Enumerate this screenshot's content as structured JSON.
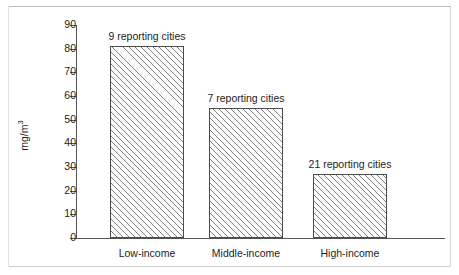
{
  "chart_data": {
    "type": "bar",
    "title": "",
    "subtitle": "",
    "xlabel": "",
    "ylabel": "mg/m",
    "ylabel_exponent": "3",
    "categories": [
      "Low-income",
      "Middle-income",
      "High-income"
    ],
    "values": [
      81,
      55,
      27
    ],
    "annotations": [
      "9 reporting cities",
      "7 reporting cities",
      "21 reporting cities"
    ],
    "ylim": [
      0,
      90
    ],
    "yticks": [
      0,
      10,
      20,
      30,
      40,
      50,
      60,
      70,
      80,
      90
    ],
    "ytick_labels": [
      "0",
      "10",
      "20",
      "30",
      "40",
      "50",
      "60",
      "70",
      "80",
      "90"
    ],
    "grid": false,
    "legend": null,
    "series": [
      {
        "name": "Particulate concentration",
        "values": [
          81,
          55,
          27
        ]
      }
    ]
  }
}
